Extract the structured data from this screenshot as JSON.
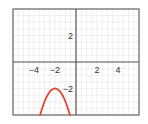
{
  "chart_data": {
    "type": "line",
    "title": "",
    "xlabel": "",
    "ylabel": "",
    "xlim": [
      -6,
      6
    ],
    "ylim": [
      -4,
      4
    ],
    "grid": true,
    "legend": null,
    "x_ticks": [
      {
        "value": -4,
        "label": "−4"
      },
      {
        "value": -2,
        "label": "−2"
      },
      {
        "value": 2,
        "label": "2"
      },
      {
        "value": 4,
        "label": "4"
      }
    ],
    "y_ticks": [
      {
        "value": 2,
        "label": "2"
      },
      {
        "value": -2,
        "label": "−2"
      }
    ],
    "series": [
      {
        "name": "y = -(x+2)^2 - 2",
        "color": "#e0453a",
        "equation": "y = -(x + 2)^2 - 2",
        "vertex": [
          -2,
          -2
        ],
        "x": [
          -3.41,
          -3.2,
          -3.0,
          -2.8,
          -2.6,
          -2.4,
          -2.2,
          -2.0,
          -1.8,
          -1.6,
          -1.4,
          -1.2,
          -1.0,
          -0.8,
          -0.59
        ],
        "values": [
          -4.0,
          -3.44,
          -3.0,
          -2.64,
          -2.36,
          -2.16,
          -2.04,
          -2.0,
          -2.04,
          -2.16,
          -2.36,
          -2.64,
          -3.0,
          -3.44,
          -4.0
        ]
      }
    ]
  },
  "colors": {
    "axis": "#555555",
    "frame": "#666666",
    "grid": "#e6e6e6",
    "curve": "#e0453a"
  }
}
